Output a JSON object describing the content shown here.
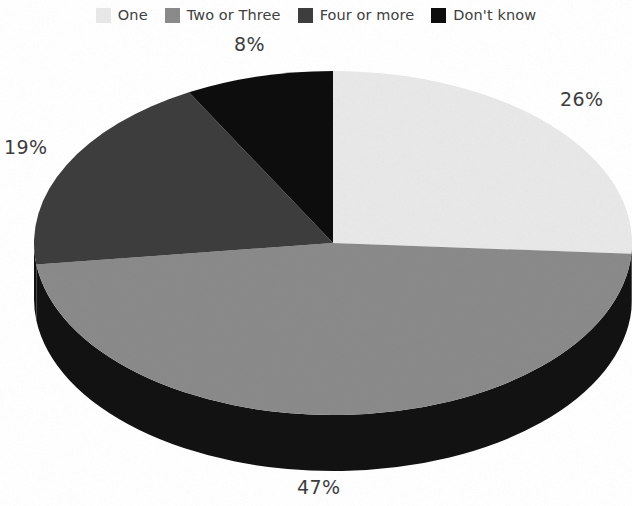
{
  "chart_data": {
    "type": "pie",
    "title": "",
    "subtitle": "",
    "xlabel": "",
    "ylabel": "",
    "legend_position": "top",
    "grid": false,
    "three_d": true,
    "categories": [
      "One",
      "Two or Three",
      "Four or more",
      "Don't know"
    ],
    "values": [
      26,
      47,
      19,
      8
    ],
    "value_labels": [
      "26%",
      "47%",
      "19%",
      "8%"
    ],
    "colors": [
      "#e8e8e8",
      "#8a8a8a",
      "#3d3d3d",
      "#0d0d0d"
    ],
    "slices": [
      {
        "label": "One",
        "value": 26,
        "display": "26%",
        "color": "#e8e8e8",
        "side_color": "#2a2a2a"
      },
      {
        "label": "Two or Three",
        "value": 47,
        "display": "47%",
        "color": "#8a8a8a",
        "side_color": "#121212"
      },
      {
        "label": "Four or more",
        "value": 19,
        "display": "19%",
        "color": "#3d3d3d",
        "side_color": "#101010"
      },
      {
        "label": "Don't know",
        "value": 8,
        "display": "8%",
        "color": "#0d0d0d",
        "side_color": "#080808"
      }
    ]
  },
  "legend": {
    "items": [
      {
        "label": "One",
        "color": "#e8e8e8"
      },
      {
        "label": "Two or Three",
        "color": "#8a8a8a"
      },
      {
        "label": "Four or more",
        "color": "#3d3d3d"
      },
      {
        "label": "Don't know",
        "color": "#0d0d0d"
      }
    ]
  },
  "labels": {
    "one": "26%",
    "two_or_three": "47%",
    "four_or_more": "19%",
    "dont_know": "8%"
  }
}
